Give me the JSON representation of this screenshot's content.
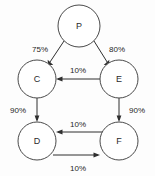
{
  "diagram": {
    "type": "directed-graph",
    "title": "",
    "background_color": "#fdfdfd",
    "node_stroke_color": "#4a4a4a",
    "edge_color": "#2f2f2f",
    "nodes": [
      {
        "id": "P",
        "label": "P",
        "cx": 79,
        "cy": 26,
        "r": 21
      },
      {
        "id": "C",
        "label": "C",
        "cx": 37,
        "cy": 79,
        "r": 19
      },
      {
        "id": "E",
        "label": "E",
        "cx": 119,
        "cy": 79,
        "r": 19
      },
      {
        "id": "D",
        "label": "D",
        "cx": 37,
        "cy": 141,
        "r": 19
      },
      {
        "id": "F",
        "label": "F",
        "cx": 119,
        "cy": 141,
        "r": 19
      }
    ],
    "edges": [
      {
        "from": "P",
        "to": "C",
        "label": "75%",
        "label_x": 40,
        "label_y": 49
      },
      {
        "from": "P",
        "to": "E",
        "label": "80%",
        "label_x": 117,
        "label_y": 49
      },
      {
        "from": "E",
        "to": "C",
        "label": "10%",
        "label_x": 78,
        "label_y": 70
      },
      {
        "from": "C",
        "to": "D",
        "label": "90%",
        "label_x": 18,
        "label_y": 110
      },
      {
        "from": "E",
        "to": "F",
        "label": "90%",
        "label_x": 137,
        "label_y": 110
      },
      {
        "from": "F",
        "to": "D",
        "label": "10%",
        "label_x": 78,
        "label_y": 124
      },
      {
        "from": "D",
        "to": "F",
        "label": "10%",
        "label_x": 78,
        "label_y": 168
      }
    ]
  }
}
